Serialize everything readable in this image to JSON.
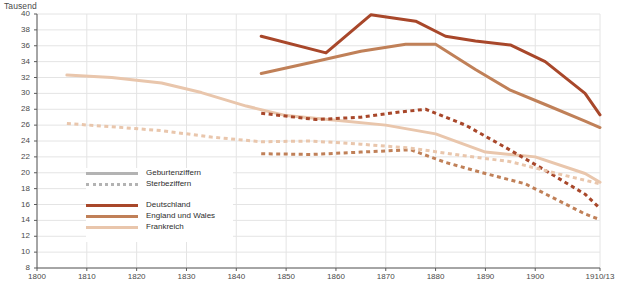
{
  "axis_unit_label": "Tausend",
  "legend": {
    "style_entries": [
      {
        "label": "Geburtenziffern",
        "style": "solid",
        "color": "#b3b3b3"
      },
      {
        "label": "Sterbeziffern",
        "style": "dashed",
        "color": "#b3b3b3"
      }
    ],
    "country_entries": [
      {
        "label": "Deutschland",
        "color": "#a8472a"
      },
      {
        "label": "England und Wales",
        "color": "#c08058"
      },
      {
        "label": "Frankreich",
        "color": "#e9c6ac"
      }
    ]
  },
  "chart_data": {
    "type": "line",
    "title": "",
    "subtitle": "",
    "xlabel": "",
    "ylabel": "Tausend",
    "xlim": [
      1800,
      1913
    ],
    "ylim": [
      8,
      40
    ],
    "grid": true,
    "legend_position": "inside-left",
    "ytick_labels": [
      "40",
      "38",
      "36",
      "34",
      "32",
      "30",
      "28",
      "26",
      "24",
      "22",
      "20",
      "18",
      "16",
      "14",
      "12",
      "10",
      "8"
    ],
    "ytick_values": [
      40,
      38,
      36,
      34,
      32,
      30,
      28,
      26,
      24,
      22,
      20,
      18,
      16,
      14,
      12,
      10,
      8
    ],
    "xtick_labels": [
      "1800",
      "1810",
      "1820",
      "1830",
      "1840",
      "1850",
      "1860",
      "1870",
      "1880",
      "1890",
      "1900",
      "1910/13"
    ],
    "xtick_values": [
      1800,
      1810,
      1820,
      1830,
      1840,
      1850,
      1860,
      1870,
      1880,
      1890,
      1900,
      1913
    ],
    "series": [
      {
        "name": "Deutschland Geburtenziffern",
        "country": "Deutschland",
        "measure": "Geburtenziffern",
        "style": "solid",
        "color": "#a8472a",
        "x": [
          1845,
          1858,
          1867,
          1876,
          1882,
          1888,
          1895,
          1902,
          1910,
          1913
        ],
        "y": [
          37.2,
          35.1,
          39.9,
          39.1,
          37.2,
          36.6,
          36.1,
          34.0,
          30.0,
          27.3
        ]
      },
      {
        "name": "England und Wales Geburtenziffern",
        "country": "England und Wales",
        "measure": "Geburtenziffern",
        "style": "solid",
        "color": "#c08058",
        "x": [
          1845,
          1855,
          1865,
          1874,
          1880,
          1888,
          1895,
          1902,
          1910,
          1913
        ],
        "y": [
          32.5,
          33.9,
          35.3,
          36.2,
          36.2,
          33.0,
          30.4,
          28.6,
          26.5,
          25.7
        ]
      },
      {
        "name": "Frankreich Geburtenziffern",
        "country": "Frankreich",
        "measure": "Geburtenziffern",
        "style": "solid",
        "color": "#e9c6ac",
        "x": [
          1806,
          1815,
          1825,
          1833,
          1842,
          1850,
          1860,
          1870,
          1880,
          1890,
          1900,
          1910,
          1913
        ],
        "y": [
          32.3,
          32.0,
          31.3,
          30.1,
          28.4,
          27.2,
          26.6,
          26.0,
          24.9,
          22.6,
          22.0,
          19.9,
          18.8
        ]
      },
      {
        "name": "Deutschland Sterbeziffern",
        "country": "Deutschland",
        "measure": "Sterbeziffern",
        "style": "dashed",
        "color": "#a8472a",
        "x": [
          1845,
          1856,
          1865,
          1872,
          1878,
          1886,
          1894,
          1902,
          1910,
          1913
        ],
        "y": [
          27.5,
          26.7,
          27.0,
          27.6,
          28.0,
          26.0,
          23.2,
          20.3,
          17.3,
          15.5
        ]
      },
      {
        "name": "England und Wales Sterbeziffern",
        "country": "England und Wales",
        "measure": "Sterbeziffern",
        "style": "dashed",
        "color": "#c08058",
        "x": [
          1845,
          1855,
          1865,
          1875,
          1882,
          1890,
          1898,
          1905,
          1910,
          1913
        ],
        "y": [
          22.4,
          22.3,
          22.6,
          22.9,
          21.3,
          19.9,
          18.6,
          16.4,
          14.8,
          14.1
        ]
      },
      {
        "name": "Frankreich Sterbeziffern",
        "country": "Frankreich",
        "measure": "Sterbeziffern",
        "style": "dashed",
        "color": "#e9c6ac",
        "x": [
          1806,
          1815,
          1825,
          1835,
          1845,
          1855,
          1865,
          1875,
          1885,
          1895,
          1905,
          1913
        ],
        "y": [
          26.2,
          25.8,
          25.3,
          24.5,
          23.9,
          24.0,
          23.6,
          23.1,
          22.2,
          21.4,
          19.8,
          18.6
        ]
      }
    ]
  }
}
